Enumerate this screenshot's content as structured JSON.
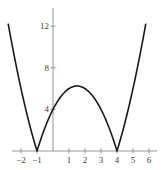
{
  "chart_data": {
    "type": "line",
    "title": "",
    "function": "y = |x^2 - 3x - 4|",
    "xlabel": "",
    "ylabel": "",
    "xlim": [
      -2.8,
      6.6
    ],
    "ylim": [
      0,
      13.5
    ],
    "x_ticks": [
      -2,
      -1,
      1,
      2,
      3,
      4,
      5,
      6
    ],
    "x_tick_labels": [
      "−2",
      "−1",
      "1",
      "2",
      "3",
      "4",
      "5",
      "6"
    ],
    "y_ticks": [
      4,
      8,
      12
    ],
    "y_tick_labels": [
      "4",
      "8",
      "12"
    ],
    "grid": false,
    "legend": null,
    "series": [
      {
        "name": "|x^2 - 3x - 4|",
        "x": [
          -2.8,
          -2.5,
          -2,
          -1.5,
          -1,
          -0.5,
          0,
          0.5,
          1,
          1.5,
          2,
          2.5,
          3,
          3.5,
          4,
          4.5,
          5,
          5.5,
          5.8
        ],
        "y": [
          13.24,
          9.75,
          6,
          2.75,
          0,
          2.25,
          4,
          5.25,
          6,
          6.25,
          6,
          5.25,
          4,
          2.25,
          0,
          2.75,
          6,
          9.75,
          12.24
        ]
      }
    ],
    "annotations": {
      "zeros": [
        -1,
        4
      ],
      "local_max": [
        1.5,
        6.25
      ],
      "y_intercept": 4
    },
    "colors": {
      "curve": "#1a1a1a",
      "axis": "#888888"
    }
  }
}
